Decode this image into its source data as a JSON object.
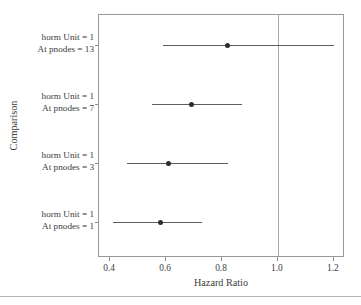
{
  "chart_data": {
    "type": "scatter",
    "subtype": "forest-plot",
    "title": "",
    "xlabel": "Hazard Ratio",
    "ylabel": "Comparison",
    "xlim": [
      0.36,
      1.24
    ],
    "xticks": [
      0.4,
      0.6,
      0.8,
      1.0,
      1.2
    ],
    "xtick_labels": [
      "0.4",
      "0.6",
      "0.8",
      "1.0",
      "1.2"
    ],
    "grid": false,
    "legend": "none",
    "reference_line": {
      "value": 1.0,
      "orientation": "vertical",
      "color": "#a8a8a8"
    },
    "marker_color": "#2e2e2e",
    "line_color": "#5d5d5d",
    "categories": [
      "horm Unit = 1 At pnodes = 13",
      "horm Unit = 1 At pnodes = 7",
      "horm Unit = 1 At pnodes = 3",
      "horm Unit = 1 At pnodes = 1"
    ],
    "rows": [
      {
        "label_line1": "horm Unit = 1",
        "label_line2": "At pnodes = 13",
        "estimate": 0.82,
        "ci_low": 0.59,
        "ci_high": 1.2
      },
      {
        "label_line1": "horm Unit = 1",
        "label_line2": "At pnodes = 7",
        "estimate": 0.69,
        "ci_low": 0.55,
        "ci_high": 0.87
      },
      {
        "label_line1": "horm Unit = 1",
        "label_line2": "At pnodes = 3",
        "estimate": 0.61,
        "ci_low": 0.46,
        "ci_high": 0.82
      },
      {
        "label_line1": "horm Unit = 1",
        "label_line2": "At pnodes = 1",
        "estimate": 0.58,
        "ci_low": 0.41,
        "ci_high": 0.73
      }
    ]
  }
}
